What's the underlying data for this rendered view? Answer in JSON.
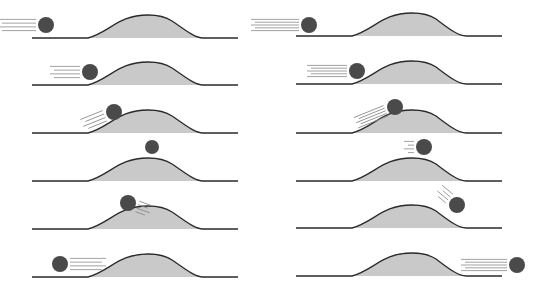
{
  "colors": {
    "background": "#ffffff",
    "hill_fill": "#c9c9c9",
    "line": "#2a2a2a",
    "ball": "#4a4a4a",
    "speed_lines": "#8a8a8a"
  },
  "columns": [
    {
      "name": "left-sequence",
      "ground_x0": 32,
      "hill_x0": 88,
      "peak_x": 158,
      "hill_x1": 203,
      "ground_x1": 238,
      "frames": [
        {
          "ground_y": 38,
          "ball": {
            "cx": 46,
            "cy": 25,
            "r": 8
          },
          "lines": {
            "dir": "left",
            "len": 38,
            "angle": 0,
            "count": 4
          }
        },
        {
          "ground_y": 85,
          "ball": {
            "cx": 90,
            "cy": 72,
            "r": 8
          },
          "lines": {
            "dir": "left",
            "len": 30,
            "angle": 0,
            "count": 4
          }
        },
        {
          "ground_y": 133,
          "ball": {
            "cx": 114,
            "cy": 112,
            "r": 8
          },
          "lines": {
            "dir": "left",
            "len": 24,
            "angle": -22,
            "count": 4
          }
        },
        {
          "ground_y": 181,
          "ball": {
            "cx": 152,
            "cy": 147,
            "r": 7
          },
          "lines": {
            "dir": "none",
            "len": 0,
            "angle": 0,
            "count": 0
          }
        },
        {
          "ground_y": 229,
          "ball": {
            "cx": 128,
            "cy": 203,
            "r": 8
          },
          "lines": {
            "dir": "right",
            "len": 14,
            "angle": 20,
            "count": 4
          }
        },
        {
          "ground_y": 277,
          "ball": {
            "cx": 60,
            "cy": 264,
            "r": 8
          },
          "lines": {
            "dir": "right",
            "len": 36,
            "angle": 0,
            "count": 4
          }
        }
      ]
    },
    {
      "name": "right-sequence",
      "ground_x0": 296,
      "hill_x0": 352,
      "peak_x": 422,
      "hill_x1": 466,
      "ground_x1": 502,
      "frames": [
        {
          "ground_y": 36,
          "ball": {
            "cx": 309,
            "cy": 25,
            "r": 8
          },
          "lines": {
            "dir": "left",
            "len": 48,
            "angle": 0,
            "count": 5
          }
        },
        {
          "ground_y": 84,
          "ball": {
            "cx": 357,
            "cy": 71,
            "r": 8
          },
          "lines": {
            "dir": "left",
            "len": 40,
            "angle": 0,
            "count": 5
          }
        },
        {
          "ground_y": 133,
          "ball": {
            "cx": 395,
            "cy": 107,
            "r": 8
          },
          "lines": {
            "dir": "left",
            "len": 32,
            "angle": -22,
            "count": 5
          }
        },
        {
          "ground_y": 181,
          "ball": {
            "cx": 424,
            "cy": 147,
            "r": 8
          },
          "lines": {
            "dir": "left",
            "len": 10,
            "angle": 0,
            "count": 4
          }
        },
        {
          "ground_y": 228,
          "ball": {
            "cx": 457,
            "cy": 205,
            "r": 8
          },
          "lines": {
            "dir": "left",
            "len": 14,
            "angle": 40,
            "count": 4
          }
        },
        {
          "ground_y": 276,
          "ball": {
            "cx": 517,
            "cy": 265,
            "r": 8
          },
          "lines": {
            "dir": "left",
            "len": 46,
            "angle": 0,
            "count": 5
          }
        }
      ]
    }
  ]
}
